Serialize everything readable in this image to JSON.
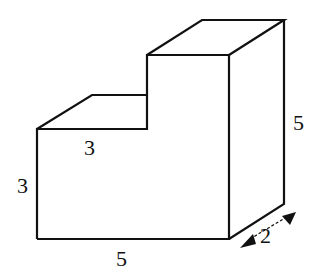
{
  "figure": {
    "type": "3D step-shaped solid (L-shaped prism)",
    "colors": {
      "stroke": "#111111",
      "background": "#ffffff"
    }
  },
  "labels": {
    "lower_step_width": "3",
    "lower_step_height": "3",
    "base_width": "5",
    "total_height": "5",
    "depth": "2"
  }
}
